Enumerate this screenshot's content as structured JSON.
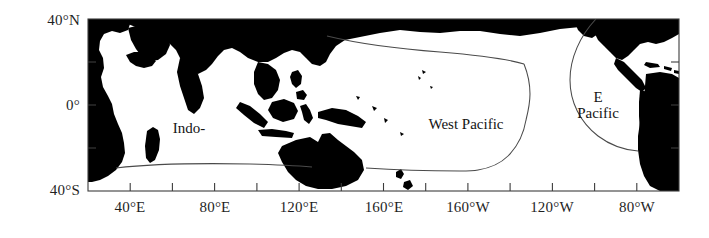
{
  "figure": {
    "type": "map",
    "projection": "equirectangular",
    "background_color": "#ffffff",
    "land_color": "#000000",
    "ocean_color": "#ffffff",
    "frame_color": "#3c3c3c",
    "boundary_color": "#4a4a4a"
  },
  "axes": {
    "x": {
      "min_lon": 20,
      "max_lon": 300,
      "tick_interval_deg": 20,
      "labels": [
        {
          "text": "40°E",
          "lon": 40
        },
        {
          "text": "80°E",
          "lon": 80
        },
        {
          "text": "120°E",
          "lon": 120
        },
        {
          "text": "160°E",
          "lon": 160
        },
        {
          "text": "160°W",
          "lon": 200
        },
        {
          "text": "120°W",
          "lon": 240
        },
        {
          "text": "80°W",
          "lon": 280
        }
      ]
    },
    "y": {
      "min_lat": -40,
      "max_lat": 40,
      "labels": [
        {
          "text": "40°N",
          "lat": 40
        },
        {
          "text": "0°",
          "lat": 0
        },
        {
          "text": "40°S",
          "lat": -40
        }
      ]
    }
  },
  "regions": [
    {
      "id": "indo",
      "label": "Indo-",
      "label_lon": 68,
      "label_lat": -12
    },
    {
      "id": "west-pacific",
      "label": "West Pacific",
      "label_lon": 173,
      "label_lat": -10
    },
    {
      "id": "e-pacific",
      "label_line1": "E",
      "label_line2": "Pacific",
      "label_lon": 250,
      "label_lat": -2
    }
  ]
}
